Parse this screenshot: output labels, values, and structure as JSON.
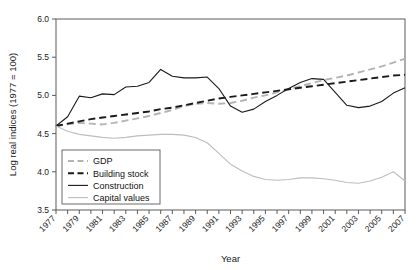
{
  "chart_data": {
    "type": "line",
    "title": "",
    "xlabel": "Year",
    "ylabel": "Log real indices (1977 = 100)",
    "xlim": [
      1977,
      2007
    ],
    "ylim": [
      3.5,
      6.0
    ],
    "yticks": [
      "3.5",
      "4.0",
      "4.5",
      "5.0",
      "5.5",
      "6.0"
    ],
    "ytick_values": [
      3.5,
      4.0,
      4.5,
      5.0,
      5.5,
      6.0
    ],
    "xticks": [
      "1977",
      "1979",
      "1981",
      "1983",
      "1985",
      "1987",
      "1989",
      "1991",
      "1993",
      "1995",
      "1997",
      "1999",
      "2001",
      "2003",
      "2005",
      "2007"
    ],
    "xtick_values": [
      1977,
      1979,
      1981,
      1983,
      1985,
      1987,
      1989,
      1991,
      1993,
      1995,
      1997,
      1999,
      2001,
      2003,
      2005,
      2007
    ],
    "x": [
      1977,
      1978,
      1979,
      1980,
      1981,
      1982,
      1983,
      1984,
      1985,
      1986,
      1987,
      1988,
      1989,
      1990,
      1991,
      1992,
      1993,
      1994,
      1995,
      1996,
      1997,
      1998,
      1999,
      2000,
      2001,
      2002,
      2003,
      2004,
      2005,
      2006,
      2007
    ],
    "grid": false,
    "legend_position": "lower-left-inside",
    "series": [
      {
        "name": "GDP",
        "color": "#b4b4b4",
        "style": "dashed",
        "values": [
          4.6,
          4.62,
          4.64,
          4.63,
          4.62,
          4.64,
          4.67,
          4.7,
          4.73,
          4.77,
          4.81,
          4.86,
          4.89,
          4.9,
          4.89,
          4.9,
          4.93,
          4.97,
          5.0,
          5.04,
          5.08,
          5.12,
          5.16,
          5.2,
          5.23,
          5.26,
          5.3,
          5.34,
          5.38,
          5.43,
          5.48
        ]
      },
      {
        "name": "Building stock",
        "color": "#1a1a1a",
        "style": "dashed",
        "values": [
          4.6,
          4.63,
          4.66,
          4.69,
          4.71,
          4.73,
          4.75,
          4.77,
          4.79,
          4.82,
          4.84,
          4.87,
          4.9,
          4.93,
          4.96,
          4.98,
          5.0,
          5.02,
          5.04,
          5.06,
          5.08,
          5.1,
          5.12,
          5.14,
          5.16,
          5.18,
          5.2,
          5.22,
          5.24,
          5.26,
          5.27
        ]
      },
      {
        "name": "Construction",
        "color": "#1a1a1a",
        "style": "solid",
        "values": [
          4.6,
          4.72,
          4.99,
          4.97,
          5.02,
          5.01,
          5.11,
          5.12,
          5.17,
          5.34,
          5.25,
          5.23,
          5.23,
          5.24,
          5.09,
          4.86,
          4.78,
          4.82,
          4.92,
          5.0,
          5.09,
          5.17,
          5.22,
          5.21,
          5.04,
          4.87,
          4.84,
          4.86,
          4.92,
          5.03,
          5.1
        ]
      },
      {
        "name": "Capital values",
        "color": "#bdbdbd",
        "style": "solid",
        "values": [
          4.6,
          4.53,
          4.49,
          4.47,
          4.45,
          4.44,
          4.45,
          4.47,
          4.48,
          4.49,
          4.49,
          4.48,
          4.45,
          4.38,
          4.24,
          4.1,
          4.01,
          3.94,
          3.9,
          3.89,
          3.9,
          3.92,
          3.92,
          3.91,
          3.89,
          3.86,
          3.85,
          3.88,
          3.93,
          4.0,
          3.88
        ]
      }
    ]
  },
  "legend": {
    "items": [
      {
        "label": "GDP"
      },
      {
        "label": "Building stock"
      },
      {
        "label": "Construction"
      },
      {
        "label": "Capital values"
      }
    ]
  }
}
